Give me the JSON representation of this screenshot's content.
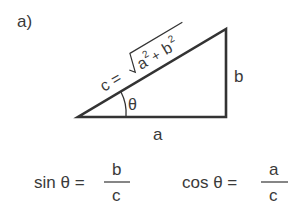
{
  "figure": {
    "panel_label": "a)",
    "triangle": {
      "vertices": {
        "left": [
          78,
          117
        ],
        "bottom_right": [
          226,
          117
        ],
        "top_right": [
          226,
          29
        ]
      },
      "hypotenuse_label": {
        "prefix": "c = ",
        "radicand_a": "a",
        "exp_a": "2",
        "plus": "+ ",
        "radicand_b": "b",
        "exp_b": "2"
      },
      "opposite_label": "b",
      "adjacent_label": "a",
      "angle_label": "θ"
    },
    "formulas": [
      {
        "lhs": "sin θ =",
        "numerator": "b",
        "denominator": "c"
      },
      {
        "lhs": "cos θ =",
        "numerator": "a",
        "denominator": "c"
      }
    ],
    "colors": {
      "stroke": "#333333",
      "background": "#ffffff"
    }
  }
}
